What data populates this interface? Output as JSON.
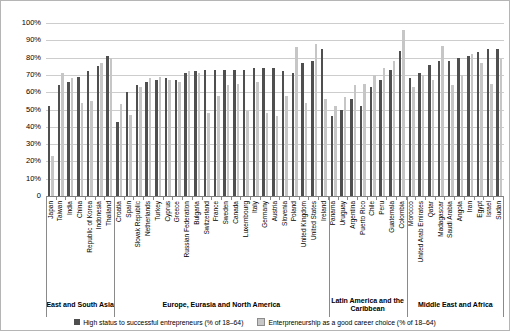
{
  "figure": {
    "background": "#ffffff",
    "border_color": "#b5b5b5"
  },
  "colors": {
    "high_status_bar": "#4f4f4f",
    "career_choice_bar": "#c6c6c6",
    "career_choice_border": "#8c8c8c",
    "gridline": "#cdcdcd",
    "axis": "#808080",
    "text": "#000000"
  },
  "y_axis": {
    "ticks": [
      {
        "label": "100%",
        "value": 100
      },
      {
        "label": "90%",
        "value": 90
      },
      {
        "label": "80%",
        "value": 80
      },
      {
        "label": "70%",
        "value": 70
      },
      {
        "label": "60%",
        "value": 60
      },
      {
        "label": "50%",
        "value": 50
      },
      {
        "label": "40%",
        "value": 40
      },
      {
        "label": "30%",
        "value": 30
      },
      {
        "label": "20%",
        "value": 20
      },
      {
        "label": "10%",
        "value": 10
      },
      {
        "label": "0",
        "value": 0
      }
    ]
  },
  "legend": [
    {
      "label": "High status to successful entrepreneurs (% of 18–64)",
      "series": "high_status"
    },
    {
      "label": "Enterpreneurship as a good career choice (% of 18–64)",
      "series": "career_choice"
    }
  ],
  "chart_data": {
    "type": "bar",
    "ylim": [
      0,
      100
    ],
    "grid": "horizontal",
    "legend_position": "bottom",
    "series_names": [
      "High status to successful entrepreneurs (% of 18–64)",
      "Enterpreneurship as a good career choice (% of 18–64)"
    ],
    "groups": [
      {
        "label": "East and South Asia",
        "countries": [
          {
            "name": "Japan",
            "values": [
              52,
              23
            ]
          },
          {
            "name": "Taiwan",
            "values": [
              64,
              71
            ]
          },
          {
            "name": "India",
            "values": [
              66,
              68
            ]
          },
          {
            "name": "China",
            "values": [
              69,
              54
            ]
          },
          {
            "name": "Republic of Korea",
            "values": [
              72,
              55
            ]
          },
          {
            "name": "Indonesia",
            "values": [
              75,
              77
            ]
          },
          {
            "name": "Thailand",
            "values": [
              81,
              80
            ]
          }
        ]
      },
      {
        "label": "Europe, Eurasia and North America",
        "countries": [
          {
            "name": "Croatia",
            "values": [
              43,
              53
            ]
          },
          {
            "name": "Spain",
            "values": [
              60,
              47
            ]
          },
          {
            "name": "Slovak Republic",
            "values": [
              64,
              63
            ]
          },
          {
            "name": "Netherlands",
            "values": [
              66,
              68
            ]
          },
          {
            "name": "Turkey",
            "values": [
              67,
              69
            ]
          },
          {
            "name": "Cyprus",
            "values": [
              68,
              67
            ]
          },
          {
            "name": "Greece",
            "values": [
              67,
              66
            ]
          },
          {
            "name": "Russian Federation",
            "values": [
              71,
              72
            ]
          },
          {
            "name": "Bulgaria",
            "values": [
              72,
              71
            ]
          },
          {
            "name": "Switzerland",
            "values": [
              73,
              48
            ]
          },
          {
            "name": "France",
            "values": [
              73,
              58
            ]
          },
          {
            "name": "Sweden",
            "values": [
              73,
              64
            ]
          },
          {
            "name": "Canada",
            "values": [
              73,
              65
            ]
          },
          {
            "name": "Luxembourg",
            "values": [
              73,
              49
            ]
          },
          {
            "name": "Italy",
            "values": [
              74,
              66
            ]
          },
          {
            "name": "Germany",
            "values": [
              74,
              48
            ]
          },
          {
            "name": "Austria",
            "values": [
              74,
              46
            ]
          },
          {
            "name": "Slovenia",
            "values": [
              72,
              58
            ]
          },
          {
            "name": "Poland",
            "values": [
              71,
              86
            ]
          },
          {
            "name": "United Kingdom",
            "values": [
              77,
              54
            ]
          },
          {
            "name": "United States",
            "values": [
              78,
              88
            ]
          },
          {
            "name": "Ireland",
            "values": [
              85,
              56
            ]
          }
        ]
      },
      {
        "label": "Latin America and the Caribbean",
        "countries": [
          {
            "name": "Panama",
            "values": [
              46,
              52
            ]
          },
          {
            "name": "Uruguay",
            "values": [
              50,
              57
            ]
          },
          {
            "name": "Argentina",
            "values": [
              56,
              64
            ]
          },
          {
            "name": "Puerto Rico",
            "values": [
              52,
              65
            ]
          },
          {
            "name": "Chile",
            "values": [
              63,
              70
            ]
          },
          {
            "name": "Peru",
            "values": [
              67,
              74
            ]
          },
          {
            "name": "Guatemala",
            "values": [
              73,
              78
            ]
          },
          {
            "name": "Colombia",
            "values": [
              84,
              96
            ]
          }
        ]
      },
      {
        "label": "Middle East and Africa",
        "countries": [
          {
            "name": "Morocco",
            "values": [
              68,
              63
            ]
          },
          {
            "name": "United Arab Emirates",
            "values": [
              71,
              70
            ]
          },
          {
            "name": "Qatar",
            "values": [
              76,
              67
            ]
          },
          {
            "name": "Madagascar",
            "values": [
              78,
              87
            ]
          },
          {
            "name": "Saudi Arabia",
            "values": [
              78,
              64
            ]
          },
          {
            "name": "Angola",
            "values": [
              80,
              70
            ]
          },
          {
            "name": "Iran",
            "values": [
              81,
              82
            ]
          },
          {
            "name": "Egypt",
            "values": [
              83,
              77
            ]
          },
          {
            "name": "Israel",
            "values": [
              85,
              65
            ]
          },
          {
            "name": "Sudan",
            "values": [
              85,
              79
            ]
          }
        ]
      }
    ]
  }
}
